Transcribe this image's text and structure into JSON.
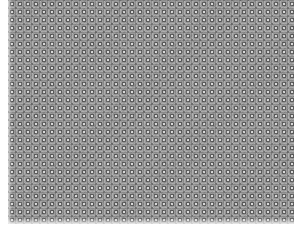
{
  "image": {
    "description": "Gray halftone ring-pattern texture",
    "colors": {
      "base": "#9a9a9a",
      "dark": "#5a5a5a",
      "light": "#d8d8d8",
      "margin": "#ffffff"
    },
    "tile_size_px": 8
  }
}
